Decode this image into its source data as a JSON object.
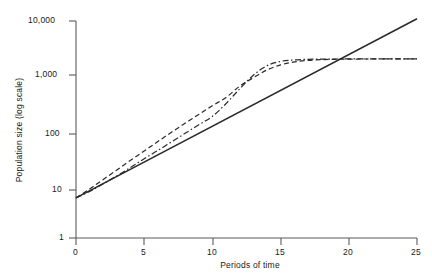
{
  "chart_data": {
    "type": "line",
    "title": "",
    "xlabel": "Periods of time",
    "ylabel": "Population size  (log scale)",
    "xlim": [
      0,
      25
    ],
    "ylim": [
      1,
      10000
    ],
    "yscale": "log",
    "grid": false,
    "legend": "none",
    "xticks": [
      0,
      5,
      10,
      15,
      20,
      25
    ],
    "xticklabels": [
      "0",
      "5",
      "10",
      "15",
      "20",
      "25"
    ],
    "yticks": [
      1,
      10,
      100,
      1000,
      10000
    ],
    "yticklabels": [
      "1",
      "10",
      "100",
      "1,000",
      "10,000"
    ],
    "series": [
      {
        "name": "exponential-growth",
        "style": "solid",
        "x": [
          0,
          25
        ],
        "values": [
          5.5,
          11000
        ]
      },
      {
        "name": "logistic-growth-dashed",
        "style": "dashed",
        "x": [
          0,
          1,
          2,
          3,
          4,
          5,
          6,
          7,
          8,
          9,
          10,
          11,
          12,
          13,
          14,
          15,
          16,
          17,
          18,
          19,
          20,
          21,
          22,
          23,
          24,
          25
        ],
        "values": [
          5.5,
          8,
          12,
          18,
          27,
          40,
          60,
          89,
          130,
          190,
          275,
          390,
          630,
          900,
          1250,
          1550,
          1760,
          1880,
          1940,
          1970,
          1985,
          1992,
          1996,
          1998,
          1999,
          2000
        ]
      },
      {
        "name": "logistic-growth-dash-dot",
        "style": "dash-dot",
        "x": [
          0,
          1,
          2,
          3,
          4,
          5,
          6,
          7,
          8,
          9,
          10,
          11,
          12,
          13,
          14,
          15,
          16,
          17,
          18,
          19,
          20,
          21,
          22,
          23,
          24,
          25
        ],
        "values": [
          5.5,
          7.2,
          10,
          14,
          20,
          29,
          41,
          59,
          85,
          122,
          175,
          300,
          560,
          1000,
          1500,
          1800,
          1920,
          1965,
          1985,
          1993,
          1997,
          1999,
          2000,
          2000,
          2000,
          2000
        ]
      }
    ],
    "colors": {
      "axis": "#5a5a5a",
      "solid_line": "#2a2a2a",
      "dashed_line": "#2a2a2a",
      "dashdot_line": "#2a2a2a",
      "text": "#1a1a1a",
      "background": "#ffffff"
    }
  }
}
